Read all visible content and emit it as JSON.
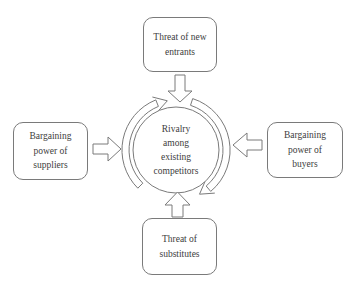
{
  "colors": {
    "line": "#7a7a7a",
    "text": "#3d3d3d",
    "background": "#ffffff"
  },
  "center_circle": {
    "lines": [
      "Rivalry",
      "among",
      "existing",
      "competitors"
    ]
  },
  "boxes": {
    "top": {
      "lines": [
        "Threat of new",
        "entrants"
      ]
    },
    "left": {
      "lines": [
        "Bargaining",
        "power of",
        "suppliers"
      ]
    },
    "right": {
      "lines": [
        "Bargaining",
        "power of",
        "buyers"
      ]
    },
    "bottom": {
      "lines": [
        "Threat of",
        "substitutes"
      ]
    }
  },
  "arrows": {
    "top_to_center": "down-block-arrow",
    "bottom_to_center": "up-block-arrow",
    "left_to_center": "right-block-arrow",
    "right_to_center": "left-block-arrow",
    "rotation": [
      "clockwise-arc-left",
      "clockwise-arc-right"
    ]
  }
}
